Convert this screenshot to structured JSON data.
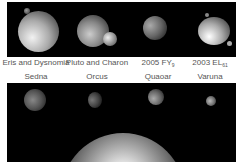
{
  "top_row": {
    "labels": [
      {
        "name": "Eris and Dysnomia",
        "x": 36
      },
      {
        "name": "Pluto and Charon",
        "x": 97
      },
      {
        "name": "2005 FY",
        "sub": "9",
        "x": 158
      },
      {
        "name": "2003 EL",
        "sub": "61",
        "x": 210
      }
    ]
  },
  "bottom_row": {
    "labels": [
      {
        "name": "Sedna",
        "x": 36
      },
      {
        "name": "Orcus",
        "x": 97
      },
      {
        "name": "Quaoar",
        "x": 158
      },
      {
        "name": "Varuna",
        "x": 210
      }
    ]
  },
  "colors": {
    "space": "#000000",
    "label": "#555555",
    "background": "#ffffff"
  }
}
